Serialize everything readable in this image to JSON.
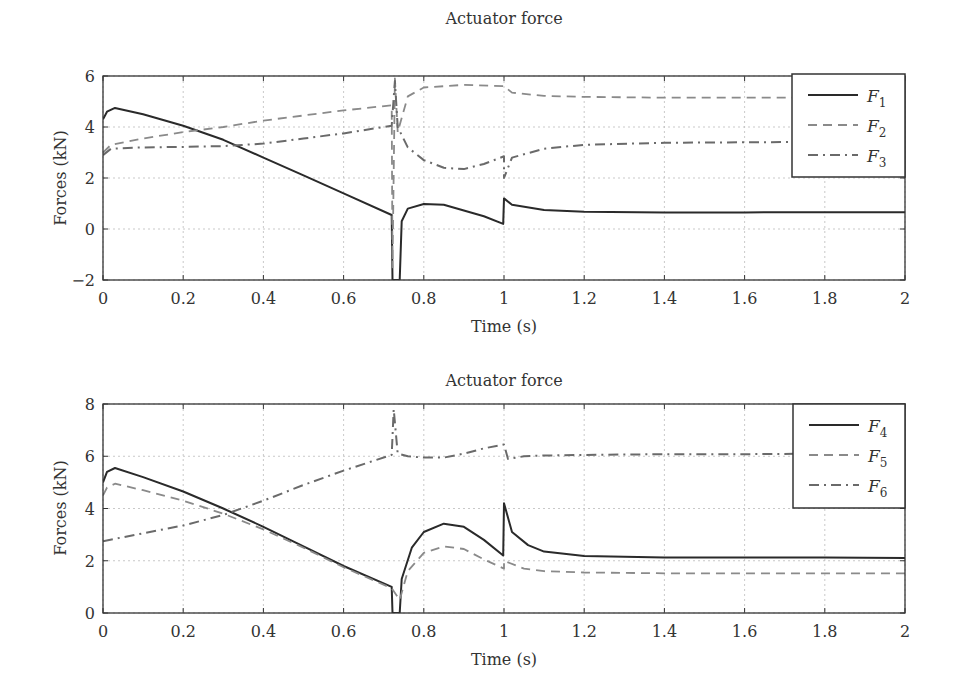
{
  "chart_data": [
    {
      "type": "line",
      "title": "Actuator force",
      "xlabel": "Time (s)",
      "ylabel": "Forces (kN)",
      "xlim": [
        0,
        2
      ],
      "ylim": [
        -2,
        6
      ],
      "xticks": [
        "0",
        "0.2",
        "0.4",
        "0.6",
        "0.8",
        "1",
        "1.2",
        "1.4",
        "1.6",
        "1.8",
        "2"
      ],
      "yticks": [
        "−2",
        "0",
        "2",
        "4",
        "6"
      ],
      "ytick_values": [
        -2,
        0,
        2,
        4,
        6
      ],
      "grid": true,
      "legend_position": "upper right",
      "series": [
        {
          "name": "F",
          "sub": "1",
          "style": "solid",
          "color": "#2a2a2a",
          "points": [
            [
              0,
              4.3
            ],
            [
              0.01,
              4.6
            ],
            [
              0.03,
              4.75
            ],
            [
              0.1,
              4.5
            ],
            [
              0.2,
              4.05
            ],
            [
              0.3,
              3.5
            ],
            [
              0.4,
              2.8
            ],
            [
              0.5,
              2.1
            ],
            [
              0.6,
              1.4
            ],
            [
              0.72,
              0.55
            ],
            [
              0.722,
              -2
            ],
            [
              0.74,
              -2
            ],
            [
              0.745,
              0.3
            ],
            [
              0.76,
              0.8
            ],
            [
              0.8,
              0.98
            ],
            [
              0.85,
              0.95
            ],
            [
              0.95,
              0.5
            ],
            [
              0.998,
              0.2
            ],
            [
              1.0,
              1.2
            ],
            [
              1.02,
              0.95
            ],
            [
              1.1,
              0.75
            ],
            [
              1.2,
              0.68
            ],
            [
              1.4,
              0.65
            ],
            [
              1.6,
              0.65
            ],
            [
              1.8,
              0.66
            ],
            [
              2.0,
              0.66
            ]
          ]
        },
        {
          "name": "F",
          "sub": "2",
          "style": "dashed",
          "color": "#8a8a8a",
          "points": [
            [
              0,
              3.0
            ],
            [
              0.02,
              3.3
            ],
            [
              0.1,
              3.55
            ],
            [
              0.2,
              3.8
            ],
            [
              0.3,
              4.0
            ],
            [
              0.4,
              4.25
            ],
            [
              0.5,
              4.45
            ],
            [
              0.6,
              4.65
            ],
            [
              0.72,
              4.85
            ],
            [
              0.722,
              -1.5
            ],
            [
              0.728,
              5.9
            ],
            [
              0.735,
              3.8
            ],
            [
              0.76,
              5.2
            ],
            [
              0.8,
              5.55
            ],
            [
              0.9,
              5.65
            ],
            [
              1.0,
              5.6
            ],
            [
              1.02,
              5.35
            ],
            [
              1.1,
              5.22
            ],
            [
              1.2,
              5.18
            ],
            [
              1.4,
              5.15
            ],
            [
              1.6,
              5.15
            ],
            [
              1.8,
              5.15
            ],
            [
              2.0,
              5.15
            ]
          ]
        },
        {
          "name": "F",
          "sub": "3",
          "style": "dashdot",
          "color": "#6a6a6a",
          "points": [
            [
              0,
              2.9
            ],
            [
              0.02,
              3.15
            ],
            [
              0.1,
              3.2
            ],
            [
              0.2,
              3.22
            ],
            [
              0.3,
              3.25
            ],
            [
              0.4,
              3.35
            ],
            [
              0.5,
              3.55
            ],
            [
              0.6,
              3.75
            ],
            [
              0.72,
              4.05
            ],
            [
              0.728,
              5.8
            ],
            [
              0.735,
              4.0
            ],
            [
              0.76,
              3.2
            ],
            [
              0.8,
              2.7
            ],
            [
              0.85,
              2.4
            ],
            [
              0.9,
              2.35
            ],
            [
              0.95,
              2.55
            ],
            [
              1.0,
              2.85
            ],
            [
              1.0,
              2.0
            ],
            [
              1.02,
              2.8
            ],
            [
              1.1,
              3.15
            ],
            [
              1.2,
              3.3
            ],
            [
              1.4,
              3.38
            ],
            [
              1.6,
              3.4
            ],
            [
              1.8,
              3.42
            ],
            [
              2.0,
              3.42
            ]
          ]
        }
      ]
    },
    {
      "type": "line",
      "title": "Actuator force",
      "xlabel": "Time (s)",
      "ylabel": "Forces (kN)",
      "xlim": [
        0,
        2
      ],
      "ylim": [
        0,
        8
      ],
      "xticks": [
        "0",
        "0.2",
        "0.4",
        "0.6",
        "0.8",
        "1",
        "1.2",
        "1.4",
        "1.6",
        "1.8",
        "2"
      ],
      "yticks": [
        "0",
        "2",
        "4",
        "6",
        "8"
      ],
      "ytick_values": [
        0,
        2,
        4,
        6,
        8
      ],
      "grid": true,
      "legend_position": "upper right",
      "series": [
        {
          "name": "F",
          "sub": "4",
          "style": "solid",
          "color": "#2a2a2a",
          "points": [
            [
              0,
              5.0
            ],
            [
              0.01,
              5.4
            ],
            [
              0.03,
              5.55
            ],
            [
              0.1,
              5.2
            ],
            [
              0.2,
              4.65
            ],
            [
              0.3,
              4.0
            ],
            [
              0.4,
              3.3
            ],
            [
              0.5,
              2.55
            ],
            [
              0.6,
              1.8
            ],
            [
              0.72,
              1.0
            ],
            [
              0.722,
              0
            ],
            [
              0.74,
              0
            ],
            [
              0.745,
              1.3
            ],
            [
              0.77,
              2.5
            ],
            [
              0.8,
              3.1
            ],
            [
              0.85,
              3.42
            ],
            [
              0.9,
              3.3
            ],
            [
              0.95,
              2.8
            ],
            [
              0.998,
              2.2
            ],
            [
              1.0,
              4.2
            ],
            [
              1.02,
              3.1
            ],
            [
              1.06,
              2.6
            ],
            [
              1.1,
              2.35
            ],
            [
              1.2,
              2.18
            ],
            [
              1.4,
              2.12
            ],
            [
              1.6,
              2.12
            ],
            [
              1.8,
              2.12
            ],
            [
              2.0,
              2.1
            ]
          ]
        },
        {
          "name": "F",
          "sub": "5",
          "style": "dashed",
          "color": "#8a8a8a",
          "points": [
            [
              0,
              4.5
            ],
            [
              0.01,
              4.8
            ],
            [
              0.03,
              4.95
            ],
            [
              0.1,
              4.7
            ],
            [
              0.2,
              4.3
            ],
            [
              0.3,
              3.8
            ],
            [
              0.4,
              3.2
            ],
            [
              0.5,
              2.5
            ],
            [
              0.6,
              1.75
            ],
            [
              0.72,
              0.95
            ],
            [
              0.74,
              0.5
            ],
            [
              0.76,
              1.6
            ],
            [
              0.8,
              2.3
            ],
            [
              0.85,
              2.55
            ],
            [
              0.9,
              2.45
            ],
            [
              0.95,
              2.05
            ],
            [
              1.0,
              1.7
            ],
            [
              1.0,
              2.0
            ],
            [
              1.05,
              1.7
            ],
            [
              1.1,
              1.6
            ],
            [
              1.2,
              1.55
            ],
            [
              1.4,
              1.52
            ],
            [
              1.6,
              1.52
            ],
            [
              1.8,
              1.52
            ],
            [
              2.0,
              1.52
            ]
          ]
        },
        {
          "name": "F",
          "sub": "6",
          "style": "dashdot",
          "color": "#6a6a6a",
          "points": [
            [
              0,
              2.75
            ],
            [
              0.05,
              2.9
            ],
            [
              0.1,
              3.05
            ],
            [
              0.2,
              3.35
            ],
            [
              0.3,
              3.75
            ],
            [
              0.4,
              4.3
            ],
            [
              0.5,
              4.9
            ],
            [
              0.6,
              5.45
            ],
            [
              0.72,
              6.05
            ],
            [
              0.725,
              7.8
            ],
            [
              0.735,
              6.1
            ],
            [
              0.76,
              6.0
            ],
            [
              0.8,
              5.95
            ],
            [
              0.85,
              5.95
            ],
            [
              0.9,
              6.1
            ],
            [
              0.95,
              6.3
            ],
            [
              1.0,
              6.45
            ],
            [
              1.01,
              5.9
            ],
            [
              1.05,
              6.0
            ],
            [
              1.1,
              6.03
            ],
            [
              1.2,
              6.05
            ],
            [
              1.4,
              6.08
            ],
            [
              1.6,
              6.08
            ],
            [
              1.8,
              6.1
            ],
            [
              2.0,
              6.1
            ]
          ]
        }
      ]
    }
  ]
}
